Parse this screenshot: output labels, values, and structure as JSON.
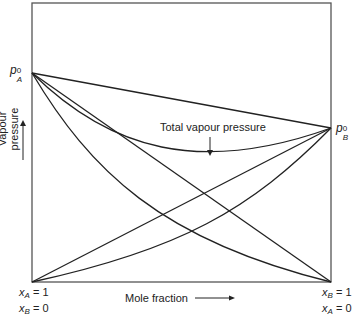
{
  "diagram": {
    "type": "vapour-pressure-composition",
    "title": "",
    "y_axis_label": "Vapour pressure",
    "x_axis_label": "Mole fraction",
    "left_point": {
      "symbol": "p",
      "subscript": "A",
      "superscript": "0"
    },
    "right_point": {
      "symbol": "p",
      "subscript": "B",
      "superscript": "0"
    },
    "left_bottom": {
      "line1": "= 1",
      "line1_var": "x",
      "line1_sub": "A",
      "line2": "= 0",
      "line2_var": "x",
      "line2_sub": "B"
    },
    "right_bottom": {
      "line1": "= 1",
      "line1_var": "x",
      "line1_sub": "B",
      "line2": "= 0",
      "line2_var": "x",
      "line2_sub": "A"
    },
    "annotation": "Total vapour pressure",
    "curves": [
      {
        "name": "ideal-total-pressure-line",
        "from": "pA0",
        "to": "pB0",
        "shape": "straight"
      },
      {
        "name": "total-vapour-pressure-curve",
        "from": "pA0",
        "to": "pB0",
        "shape": "negative-deviation-minimum"
      },
      {
        "name": "ideal-partial-pressure-A-line",
        "from": "pA0",
        "to": "xB=1 baseline",
        "shape": "straight"
      },
      {
        "name": "partial-pressure-A-curve",
        "from": "pA0",
        "to": "xB=1 baseline",
        "shape": "curved-below"
      },
      {
        "name": "ideal-partial-pressure-B-line",
        "from": "xA=1 baseline",
        "to": "pB0",
        "shape": "straight"
      },
      {
        "name": "partial-pressure-B-curve",
        "from": "xA=1 baseline",
        "to": "pB0",
        "shape": "curved-below"
      }
    ],
    "colors": {
      "line": "#222222",
      "frame": "#555555",
      "background": "#ffffff"
    }
  }
}
